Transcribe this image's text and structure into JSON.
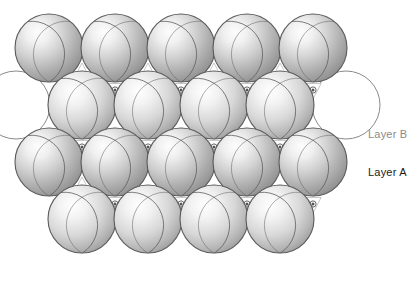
{
  "figure": {
    "background_color": "#ffffff",
    "sphere_fill_light": "#f4f4f4",
    "sphere_fill_mid": "#c9c9c9",
    "sphere_fill_dark": "#8e8e8e",
    "sphere_stroke": "#5a5a5a",
    "outline_circle_stroke": "#8a8a8a",
    "hole_marker_color": "#555555",
    "sphere_radius": 34,
    "row_spacing": 57,
    "column_spacing": 66
  },
  "labels": {
    "layer_b": {
      "text": "Layer B",
      "color": "#8a8a8a",
      "x": 368,
      "y": 138
    },
    "layer_a": {
      "text": "Layer A",
      "color": "#1a1a1a",
      "x": 368,
      "y": 176
    }
  },
  "legend_markers": {
    "tetrahedral": {
      "name": "x-mark",
      "glyph": "x",
      "description": "tetrahedral hole marker in upward triangle"
    },
    "octahedral": {
      "name": "dot-mark",
      "glyph": "•",
      "description": "octahedral hole marker in downward triangle"
    }
  },
  "rows": [
    {
      "id": "row-1",
      "layer": "A",
      "cy": 48,
      "count": 5,
      "centers_x": [
        49,
        115,
        181,
        247,
        313
      ],
      "style": "filled"
    },
    {
      "id": "row-2",
      "layer": "B",
      "cy": 105,
      "count": 4,
      "centers_x": [
        82,
        148,
        214,
        280
      ],
      "style": "filled",
      "outline_ghosts_x": [
        16,
        346
      ]
    },
    {
      "id": "row-3",
      "layer": "A",
      "cy": 162,
      "count": 5,
      "centers_x": [
        49,
        115,
        181,
        247,
        313
      ],
      "style": "filled"
    },
    {
      "id": "row-4",
      "layer": "B",
      "cy": 219,
      "count": 4,
      "centers_x": [
        82,
        148,
        214,
        280
      ],
      "style": "filled"
    }
  ],
  "holes": {
    "tetrahedral_up": [
      {
        "x": 82,
        "y": 72
      },
      {
        "x": 148,
        "y": 72
      },
      {
        "x": 214,
        "y": 72
      },
      {
        "x": 280,
        "y": 72
      },
      {
        "x": 115,
        "y": 186
      },
      {
        "x": 181,
        "y": 186
      },
      {
        "x": 247,
        "y": 186
      },
      {
        "x": 313,
        "y": 186
      },
      {
        "x": 82,
        "y": 186
      }
    ],
    "octahedral_down": [
      {
        "x": 115,
        "y": 90
      },
      {
        "x": 181,
        "y": 90
      },
      {
        "x": 247,
        "y": 90
      },
      {
        "x": 313,
        "y": 90
      },
      {
        "x": 82,
        "y": 147
      },
      {
        "x": 148,
        "y": 147
      },
      {
        "x": 214,
        "y": 147
      },
      {
        "x": 280,
        "y": 147
      },
      {
        "x": 115,
        "y": 204
      },
      {
        "x": 181,
        "y": 204
      },
      {
        "x": 247,
        "y": 204
      },
      {
        "x": 313,
        "y": 204
      }
    ]
  }
}
